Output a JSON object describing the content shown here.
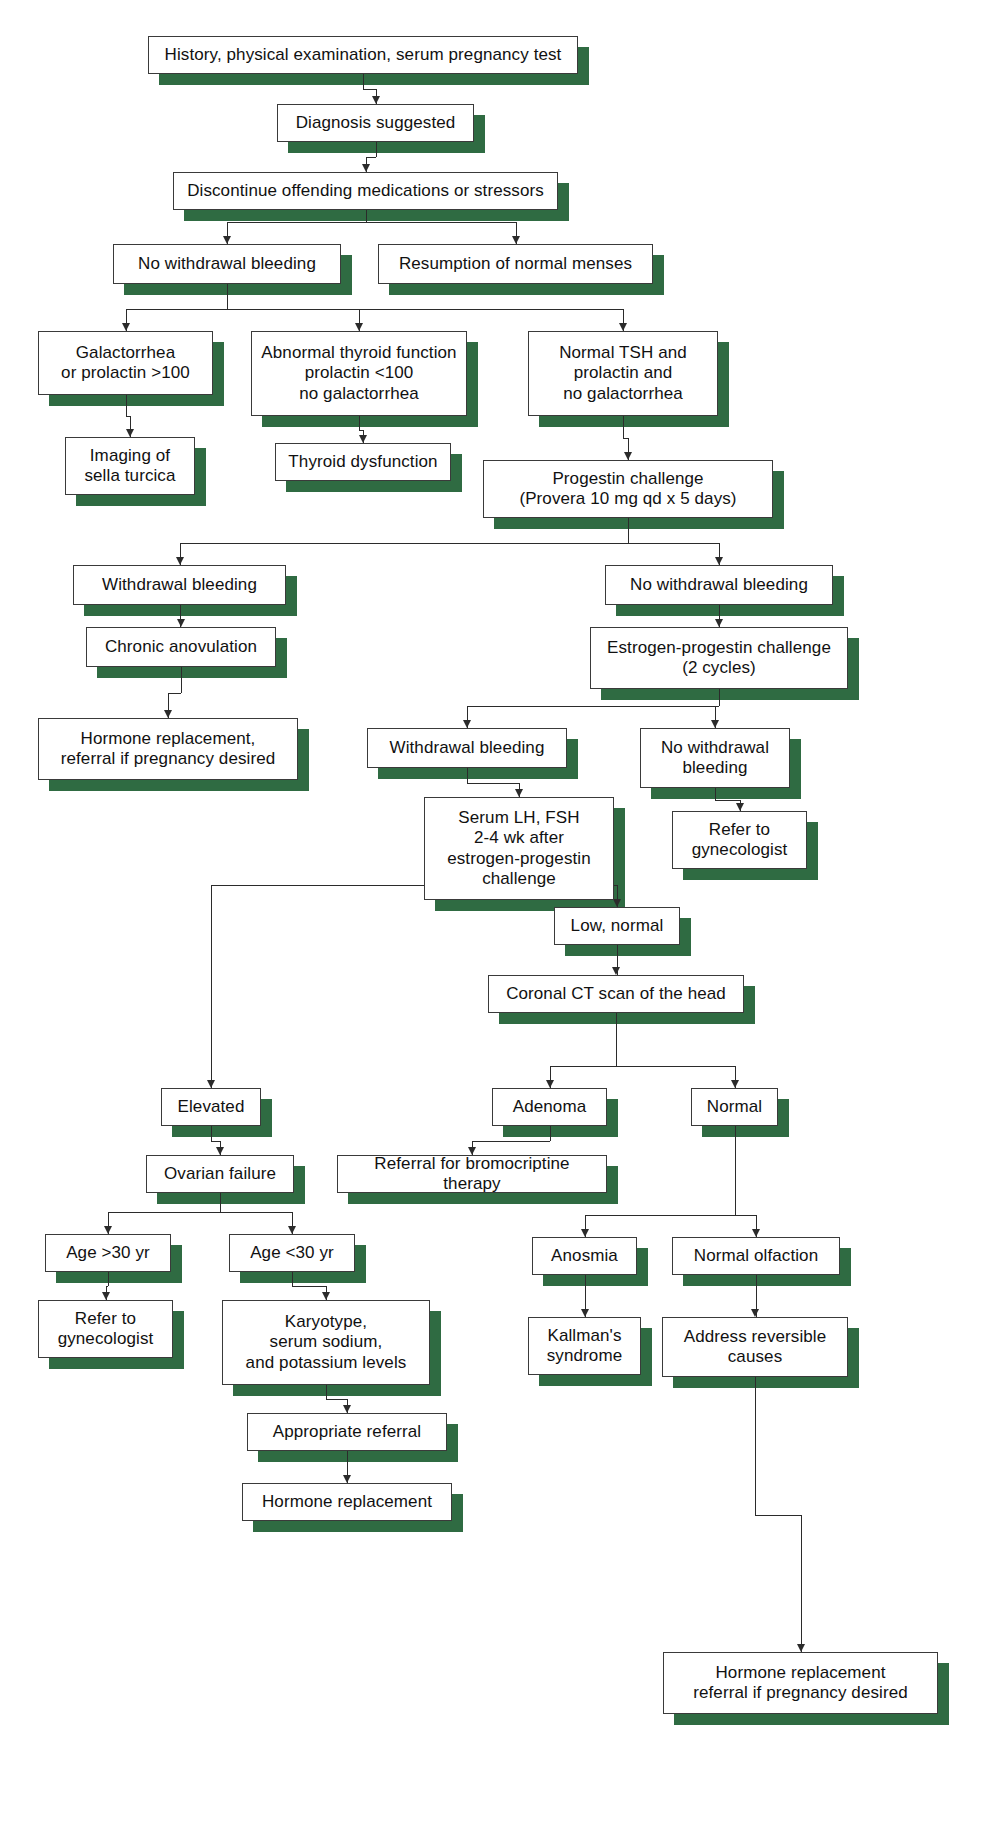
{
  "diagram": {
    "accent_green": "#2f6b42",
    "box_border": "#3a3a3a",
    "text_color": "#111111",
    "background": "#ffffff",
    "nodes": [
      {
        "id": "history",
        "label": "History, physical examination, serum pregnancy test",
        "x": 148,
        "y": 36,
        "w": 430,
        "h": 38
      },
      {
        "id": "diagnosis",
        "label": "Diagnosis suggested",
        "x": 277,
        "y": 104,
        "w": 197,
        "h": 38
      },
      {
        "id": "discontinue",
        "label": "Discontinue offending medications or stressors",
        "x": 173,
        "y": 172,
        "w": 385,
        "h": 38
      },
      {
        "id": "no-withdrawal-1",
        "label": "No withdrawal bleeding",
        "x": 113,
        "y": 244,
        "w": 228,
        "h": 40
      },
      {
        "id": "resumption",
        "label": "Resumption of normal menses",
        "x": 378,
        "y": 244,
        "w": 275,
        "h": 40
      },
      {
        "id": "galactorrhea",
        "label": "Galactorrhea\nor prolactin >100",
        "x": 38,
        "y": 331,
        "w": 175,
        "h": 64
      },
      {
        "id": "abnormal-thyroid",
        "label": "Abnormal thyroid function\nprolactin <100\nno galactorrhea",
        "x": 251,
        "y": 331,
        "w": 216,
        "h": 85
      },
      {
        "id": "normal-tsh",
        "label": "Normal TSH and\nprolactin and\nno galactorrhea",
        "x": 528,
        "y": 331,
        "w": 190,
        "h": 85
      },
      {
        "id": "imaging-sella",
        "label": "Imaging of\nsella turcica",
        "x": 65,
        "y": 437,
        "w": 130,
        "h": 58
      },
      {
        "id": "thyroid-dysfunction",
        "label": "Thyroid dysfunction",
        "x": 275,
        "y": 443,
        "w": 176,
        "h": 38
      },
      {
        "id": "progestin",
        "label": "Progestin challenge\n(Provera 10 mg qd x 5 days)",
        "x": 483,
        "y": 460,
        "w": 290,
        "h": 58
      },
      {
        "id": "withdrawal-1",
        "label": "Withdrawal bleeding",
        "x": 73,
        "y": 565,
        "w": 213,
        "h": 40
      },
      {
        "id": "no-withdrawal-2",
        "label": "No withdrawal bleeding",
        "x": 605,
        "y": 565,
        "w": 228,
        "h": 40
      },
      {
        "id": "chronic-anovulation",
        "label": "Chronic anovulation",
        "x": 86,
        "y": 627,
        "w": 190,
        "h": 40
      },
      {
        "id": "estrogen-progestin",
        "label": "Estrogen-progestin challenge\n(2 cycles)",
        "x": 590,
        "y": 627,
        "w": 258,
        "h": 62
      },
      {
        "id": "hormone-repl-1",
        "label": "Hormone replacement,\nreferral if pregnancy desired",
        "x": 38,
        "y": 718,
        "w": 260,
        "h": 62
      },
      {
        "id": "withdrawal-2",
        "label": "Withdrawal bleeding",
        "x": 367,
        "y": 728,
        "w": 200,
        "h": 40
      },
      {
        "id": "no-withdrawal-3",
        "label": "No withdrawal\nbleeding",
        "x": 640,
        "y": 728,
        "w": 150,
        "h": 60
      },
      {
        "id": "serum-lh-fsh",
        "label": "Serum LH, FSH\n2-4 wk after\nestrogen-progestin\nchallenge",
        "x": 424,
        "y": 797,
        "w": 190,
        "h": 103
      },
      {
        "id": "refer-gyn-1",
        "label": "Refer to\ngynecologist",
        "x": 672,
        "y": 811,
        "w": 135,
        "h": 58
      },
      {
        "id": "low-normal",
        "label": "Low, normal",
        "x": 554,
        "y": 907,
        "w": 126,
        "h": 38
      },
      {
        "id": "coronal-ct",
        "label": "Coronal CT scan of the head",
        "x": 488,
        "y": 975,
        "w": 256,
        "h": 38
      },
      {
        "id": "elevated",
        "label": "Elevated",
        "x": 161,
        "y": 1088,
        "w": 100,
        "h": 38
      },
      {
        "id": "adenoma",
        "label": "Adenoma",
        "x": 492,
        "y": 1088,
        "w": 115,
        "h": 38
      },
      {
        "id": "normal",
        "label": "Normal",
        "x": 691,
        "y": 1088,
        "w": 87,
        "h": 38
      },
      {
        "id": "ovarian-failure",
        "label": "Ovarian failure",
        "x": 146,
        "y": 1155,
        "w": 148,
        "h": 38
      },
      {
        "id": "referral-bromo",
        "label": "Referral for bromocriptine therapy",
        "x": 337,
        "y": 1155,
        "w": 270,
        "h": 38
      },
      {
        "id": "age-over-30",
        "label": "Age >30 yr",
        "x": 45,
        "y": 1234,
        "w": 126,
        "h": 38
      },
      {
        "id": "age-under-30",
        "label": "Age <30 yr",
        "x": 229,
        "y": 1234,
        "w": 126,
        "h": 38
      },
      {
        "id": "anosmia",
        "label": "Anosmia",
        "x": 532,
        "y": 1237,
        "w": 105,
        "h": 38
      },
      {
        "id": "normal-olfaction",
        "label": "Normal olfaction",
        "x": 672,
        "y": 1237,
        "w": 168,
        "h": 38
      },
      {
        "id": "refer-gyn-2",
        "label": "Refer to\ngynecologist",
        "x": 38,
        "y": 1300,
        "w": 135,
        "h": 58
      },
      {
        "id": "karyotype",
        "label": "Karyotype,\nserum sodium,\nand potassium levels",
        "x": 222,
        "y": 1300,
        "w": 208,
        "h": 85
      },
      {
        "id": "kallmans",
        "label": "Kallman's\nsyndrome",
        "x": 528,
        "y": 1317,
        "w": 113,
        "h": 58
      },
      {
        "id": "address-reversible",
        "label": "Address reversible\ncauses",
        "x": 662,
        "y": 1317,
        "w": 186,
        "h": 60
      },
      {
        "id": "appropriate-referral",
        "label": "Appropriate referral",
        "x": 247,
        "y": 1413,
        "w": 200,
        "h": 38
      },
      {
        "id": "hormone-repl-2",
        "label": "Hormone replacement",
        "x": 242,
        "y": 1483,
        "w": 210,
        "h": 38
      },
      {
        "id": "hormone-repl-3",
        "label": "Hormone replacement\nreferral if pregnancy desired",
        "x": 663,
        "y": 1652,
        "w": 275,
        "h": 62
      }
    ],
    "connectors": [
      {
        "id": "history-to-diagnosis",
        "type": "straight",
        "from": "history",
        "to": "diagnosis"
      },
      {
        "id": "diagnosis-to-discontinue",
        "type": "straight",
        "from": "diagnosis",
        "to": "discontinue"
      },
      {
        "id": "discontinue-split",
        "type": "split",
        "from": "discontinue",
        "to": [
          "no-withdrawal-1",
          "resumption"
        ]
      },
      {
        "id": "no-withdrawal-1-split",
        "type": "split",
        "from": "no-withdrawal-1",
        "to": [
          "galactorrhea",
          "abnormal-thyroid",
          "normal-tsh"
        ]
      },
      {
        "id": "galactorrhea-to-imaging",
        "type": "straight",
        "from": "galactorrhea",
        "to": "imaging-sella"
      },
      {
        "id": "abnormal-thyroid-to-dysfunction",
        "type": "straight",
        "from": "abnormal-thyroid",
        "to": "thyroid-dysfunction"
      },
      {
        "id": "normal-tsh-to-progestin",
        "type": "straight",
        "from": "normal-tsh",
        "to": "progestin"
      },
      {
        "id": "progestin-split",
        "type": "split",
        "from": "progestin",
        "to": [
          "withdrawal-1",
          "no-withdrawal-2"
        ]
      },
      {
        "id": "withdrawal-1-to-anovulation",
        "type": "straight",
        "from": "withdrawal-1",
        "to": "chronic-anovulation"
      },
      {
        "id": "anovulation-to-hormone",
        "type": "straight",
        "from": "chronic-anovulation",
        "to": "hormone-repl-1"
      },
      {
        "id": "no-withdrawal-2-to-estrogen",
        "type": "straight",
        "from": "no-withdrawal-2",
        "to": "estrogen-progestin"
      },
      {
        "id": "estrogen-split",
        "type": "split",
        "from": "estrogen-progestin",
        "to": [
          "withdrawal-2",
          "no-withdrawal-3"
        ]
      },
      {
        "id": "withdrawal-2-to-serum",
        "type": "straight",
        "from": "withdrawal-2",
        "to": "serum-lh-fsh"
      },
      {
        "id": "no-withdrawal-3-to-refer",
        "type": "straight",
        "from": "no-withdrawal-3",
        "to": "refer-gyn-1"
      },
      {
        "id": "serum-split",
        "type": "split",
        "from": "serum-lh-fsh",
        "to": [
          "elevated",
          "low-normal"
        ]
      },
      {
        "id": "low-normal-to-ct",
        "type": "straight",
        "from": "low-normal",
        "to": "coronal-ct"
      },
      {
        "id": "ct-split",
        "type": "split",
        "from": "coronal-ct",
        "to": [
          "adenoma",
          "normal"
        ]
      },
      {
        "id": "elevated-to-ovarian",
        "type": "straight",
        "from": "elevated",
        "to": "ovarian-failure"
      },
      {
        "id": "adenoma-to-bromo",
        "type": "straight",
        "from": "adenoma",
        "to": "referral-bromo"
      },
      {
        "id": "ovarian-split",
        "type": "split",
        "from": "ovarian-failure",
        "to": [
          "age-over-30",
          "age-under-30"
        ]
      },
      {
        "id": "normal-split",
        "type": "split",
        "from": "normal",
        "to": [
          "anosmia",
          "normal-olfaction"
        ]
      },
      {
        "id": "age-over-30-to-refer",
        "type": "straight",
        "from": "age-over-30",
        "to": "refer-gyn-2"
      },
      {
        "id": "age-under-30-to-karyotype",
        "type": "straight",
        "from": "age-under-30",
        "to": "karyotype"
      },
      {
        "id": "anosmia-to-kallmans",
        "type": "straight",
        "from": "anosmia",
        "to": "kallmans"
      },
      {
        "id": "olfaction-to-address",
        "type": "straight",
        "from": "normal-olfaction",
        "to": "address-reversible"
      },
      {
        "id": "karyotype-to-appropriate",
        "type": "straight",
        "from": "karyotype",
        "to": "appropriate-referral"
      },
      {
        "id": "appropriate-to-hormone",
        "type": "straight",
        "from": "appropriate-referral",
        "to": "hormone-repl-2"
      },
      {
        "id": "address-to-hormone",
        "type": "straight",
        "from": "address-reversible",
        "to": "hormone-repl-3"
      }
    ]
  }
}
